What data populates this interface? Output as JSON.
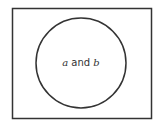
{
  "diagram": {
    "type": "venn",
    "universe": {
      "label": ""
    },
    "circles": [
      {
        "id": "ab",
        "label_parts": [
          {
            "text": "a",
            "italic": true
          },
          {
            "text": " and ",
            "italic": false
          },
          {
            "text": "b",
            "italic": true
          }
        ]
      }
    ],
    "label_text": "a and b",
    "stroke_color": "#333333",
    "background_color": "#ffffff"
  }
}
